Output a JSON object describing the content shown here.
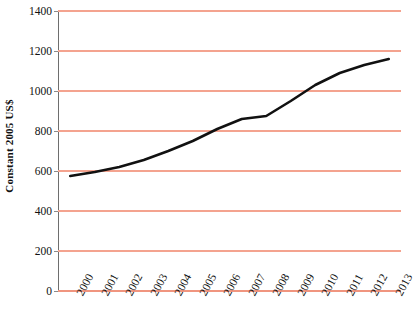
{
  "chart_data": {
    "type": "line",
    "title": "",
    "xlabel": "",
    "ylabel": "Constant 2005 US$",
    "categories": [
      "2000",
      "2001",
      "2002",
      "2003",
      "2004",
      "2005",
      "2006",
      "2007",
      "2008",
      "2009",
      "2010",
      "2011",
      "2012",
      "2013"
    ],
    "values": [
      575,
      595,
      620,
      655,
      700,
      750,
      810,
      860,
      875,
      950,
      1030,
      1090,
      1130,
      1160
    ],
    "series": [
      {
        "name": "Constant 2005 US$",
        "values": [
          575,
          595,
          620,
          655,
          700,
          750,
          810,
          860,
          875,
          950,
          1030,
          1090,
          1130,
          1160
        ]
      }
    ],
    "ylim": [
      0,
      1400
    ],
    "ytick_values": [
      0,
      200,
      400,
      600,
      800,
      1000,
      1200,
      1400
    ],
    "ytick_labels": [
      "0",
      "200",
      "400",
      "600",
      "800",
      "1000",
      "1200",
      "1400"
    ],
    "grid": "horizontal",
    "legend": "none",
    "line_color": "#111111",
    "gridline_color": "#f4a38f",
    "axis_color": "#6e6e6e",
    "background_color": "#ffffff",
    "x_tick_rotation_deg": -62
  },
  "title_remnant": "",
  "axes": {
    "y_title": "Constant 2005 US$"
  }
}
